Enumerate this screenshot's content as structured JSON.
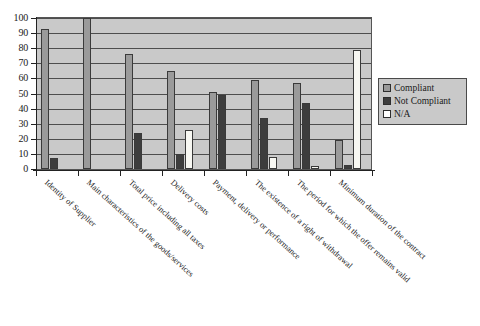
{
  "chart_data": {
    "type": "bar",
    "title": "",
    "subtitle": "",
    "xlabel": "",
    "ylabel": "",
    "ylim": [
      0,
      100
    ],
    "ytick_step": 10,
    "yticks": [
      100,
      90,
      80,
      70,
      60,
      50,
      40,
      30,
      20,
      10,
      0
    ],
    "grid": true,
    "grid_axis": "y",
    "legend_position": "right",
    "categories": [
      "Identity of Supplier",
      "Main characteristics of the goods/services",
      "Total price including all taxes",
      "Delivery costs",
      "Payment, delivery or performance",
      "The existence of a right of withdrawal",
      "The period for which the offer remains valid",
      "Minimum duration of the contract"
    ],
    "series": [
      {
        "name": "Compliant",
        "color": "#9a9a9a",
        "values": [
          93,
          100,
          76,
          65,
          51,
          59,
          57,
          19
        ]
      },
      {
        "name": "Not Compliant",
        "color": "#3d3d3d",
        "values": [
          7,
          0,
          24,
          10,
          49,
          34,
          44,
          3
        ]
      },
      {
        "name": "N/A",
        "color": "#ffffff",
        "values": [
          0,
          0,
          0,
          26,
          0,
          8,
          2,
          79
        ]
      }
    ]
  },
  "legend": {
    "items": [
      {
        "label": "Compliant"
      },
      {
        "label": "Not Compliant"
      },
      {
        "label": "N/A"
      }
    ]
  }
}
